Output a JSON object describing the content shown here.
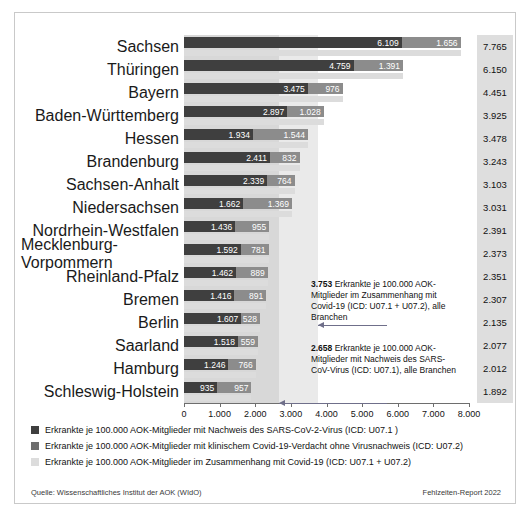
{
  "chart_data": {
    "type": "bar",
    "orientation": "horizontal",
    "stacked": true,
    "title": "",
    "xlabel": "",
    "ylabel": "",
    "xlim": [
      0,
      8000
    ],
    "xticks": [
      "0",
      "1.000",
      "2.000",
      "3.000",
      "4.000",
      "5.000",
      "6.000",
      "7.000",
      "8.000"
    ],
    "xtick_values": [
      0,
      1000,
      2000,
      3000,
      4000,
      5000,
      6000,
      7000,
      8000
    ],
    "grid": false,
    "legend_position": "bottom",
    "categories": [
      "Sachsen",
      "Thüringen",
      "Bayern",
      "Baden-Württemberg",
      "Hessen",
      "Brandenburg",
      "Sachsen-Anhalt",
      "Niedersachsen",
      "Nordrhein-Westfalen",
      "Mecklenburg-Vorpommern",
      "Rheinland-Pfalz",
      "Bremen",
      "Berlin",
      "Saarland",
      "Hamburg",
      "Schleswig-Holstein"
    ],
    "series": [
      {
        "name": "Erkrankte je 100.000 AOK-Mitglieder mit Nachweis des SARS-CoV-2-Virus (ICD: U07.1 )",
        "color": "#3f3f3f",
        "values": [
          6109,
          4759,
          3475,
          2897,
          1934,
          2411,
          2339,
          1662,
          1436,
          1592,
          1462,
          1416,
          1607,
          1518,
          1246,
          935
        ],
        "labels": [
          "6.109",
          "4.759",
          "3.475",
          "2.897",
          "1.934",
          "2.411",
          "2.339",
          "1.662",
          "1.436",
          "1.592",
          "1.462",
          "1.416",
          "1.607",
          "1.518",
          "1.246",
          "935"
        ]
      },
      {
        "name": "Erkrankte je 100.000 AOK-Mitglieder mit klinischem Covid-19-Verdacht ohne Virusnachweis (ICD: U07.2)",
        "color": "#8c8c8c",
        "values": [
          1656,
          1391,
          976,
          1028,
          1544,
          832,
          764,
          1369,
          955,
          781,
          889,
          891,
          528,
          559,
          766,
          957
        ],
        "labels": [
          "1.656",
          "1.391",
          "976",
          "1.028",
          "1.544",
          "832",
          "764",
          "1.369",
          "955",
          "781",
          "889",
          "891",
          "528",
          "559",
          "766",
          "957"
        ]
      },
      {
        "name": "Erkrankte je 100.000 AOK-Mitglieder im Zusammenhang mit Covid-19 (ICD: U07.1 + U07.2)",
        "color": "#dcdcdc",
        "values": [
          7765,
          6150,
          4451,
          3925,
          3478,
          3243,
          3103,
          3031,
          2391,
          2373,
          2351,
          2307,
          2135,
          2077,
          2012,
          1892
        ],
        "labels": [
          "7.765",
          "6.150",
          "4.451",
          "3.925",
          "3.478",
          "3.243",
          "3.103",
          "3.031",
          "2.391",
          "2.373",
          "2.351",
          "2.307",
          "2.135",
          "2.077",
          "2.012",
          "1.892"
        ]
      }
    ],
    "totals_column": {
      "values": [
        7765,
        6150,
        4451,
        3925,
        3478,
        3243,
        3103,
        3031,
        2391,
        2373,
        2351,
        2307,
        2135,
        2077,
        2012,
        1892
      ],
      "labels": [
        "7.765",
        "6.150",
        "4.451",
        "3.925",
        "3.478",
        "3.243",
        "3.103",
        "3.031",
        "2.391",
        "2.373",
        "2.351",
        "2.307",
        "2.135",
        "2.077",
        "2.012",
        "1.892"
      ]
    },
    "reference_bands": [
      {
        "name": "gesamt-covid19",
        "value": 3753,
        "color": "#eaeaea"
      },
      {
        "name": "sars-cov-nachweis",
        "value": 2658,
        "color": "#d8d8d8"
      }
    ],
    "annotations": [
      {
        "value_label": "3.753",
        "text": " Erkrankte je 100.000 AOK-Mitglieder im Zusammenhang mit Covid-19 (ICD: U07.1 + U07.2), alle Branchen",
        "points_to": 3753
      },
      {
        "value_label": "2.658",
        "text": " Erkrankte je 100.000 AOK-Mitglieder mit Nachweis des SARS-CoV-Virus (ICD: U07.1), alle Branchen",
        "points_to": 2658
      }
    ]
  },
  "legend": [
    "Erkrankte je 100.000 AOK-Mitglieder mit Nachweis des SARS-CoV-2-Virus (ICD: U07.1 )",
    "Erkrankte je 100.000 AOK-Mitglieder mit klinischem Covid-19-Verdacht ohne Virusnachweis (ICD: U07.2)",
    "Erkrankte je 100.000 AOK-Mitglieder im Zusammenhang mit Covid-19 (ICD: U07.1 + U07.2)"
  ],
  "footer": {
    "source": "Quelle: Wissenschaftliches Institut der AOK (WIdO)",
    "report": "Fehlzeiten-Report 2022"
  }
}
